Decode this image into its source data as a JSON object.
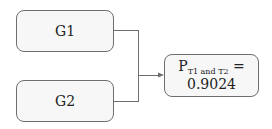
{
  "nodes": {
    "g1": {
      "label": "G1"
    },
    "g2": {
      "label": "G2"
    },
    "result": {
      "p_label": "P",
      "subscript": "T1 and T2",
      "equals": " =",
      "value": "0.9024"
    }
  },
  "colors": {
    "border": "#6e6e6e",
    "fill": "#f7f7f7",
    "text": "#222222"
  }
}
